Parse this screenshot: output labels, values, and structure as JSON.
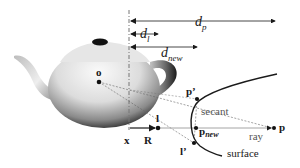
{
  "diagram": {
    "type": "ray-surface secant refinement illustration",
    "colors": {
      "background": "#ffffff",
      "ink": "#1a1a1a",
      "dashed_line": "#777777",
      "ray_line": "#9a9a9a",
      "teapot_light": "#f4f4f4",
      "teapot_dark": "#1e1e1e"
    },
    "object": {
      "name": "teapot"
    },
    "distances": {
      "dp": {
        "base": "d",
        "sub": "p"
      },
      "dl": {
        "base": "d",
        "sub": "l"
      },
      "dnew": {
        "base": "d",
        "sub": "new"
      }
    },
    "points": {
      "o": "o",
      "x": "x",
      "R": "R",
      "l": "l",
      "l_prime": "l’",
      "p_prime": "p’",
      "p_new": {
        "base": "p",
        "sub": "new"
      },
      "p": "p"
    },
    "labels": {
      "secant": "secant",
      "ray": "ray",
      "surface": "surface"
    }
  }
}
